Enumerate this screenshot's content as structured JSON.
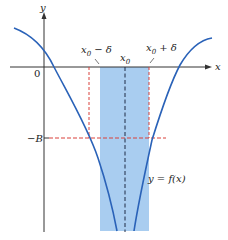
{
  "diagram": {
    "axes": {
      "x_label": "x",
      "y_label": "y",
      "origin_label": "0"
    },
    "labels": {
      "x0": "x",
      "x0_sub": "0",
      "x0_minus_delta": "x",
      "x0_minus_delta_sub": "0",
      "x0_minus_delta_suffix": " − δ",
      "x0_plus_delta": "x",
      "x0_plus_delta_sub": "0",
      "x0_plus_delta_suffix": " + δ",
      "neg_B": "−B",
      "curve": "y = f(x)"
    },
    "colors": {
      "curve": "#2a62b8",
      "band": "#a9cdf0",
      "red_dash": "#d9403a",
      "axis": "#333333",
      "center_dash": "#1f2a44"
    }
  }
}
